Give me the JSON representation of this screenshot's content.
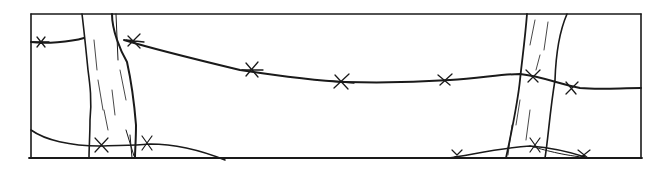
{
  "illustration": {
    "subject": "barbed wire fence with two wooden posts",
    "style": "black ink line drawing",
    "colors": {
      "ink": "#1a1a1a",
      "background": "#ffffff"
    },
    "frame": {
      "left": 31,
      "top": 14,
      "right": 641,
      "bottom": 158
    },
    "posts": [
      {
        "name": "left-post",
        "x_range": [
          80,
          136
        ]
      },
      {
        "name": "right-post",
        "x_range": [
          505,
          568
        ]
      }
    ],
    "wires": [
      {
        "name": "upper-wire",
        "barbs": 7
      },
      {
        "name": "lower-wire",
        "barbs": 5
      }
    ]
  }
}
